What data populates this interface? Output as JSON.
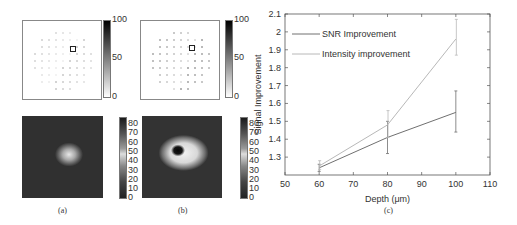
{
  "figure": {
    "panels": [
      {
        "id": "a",
        "caption": "(a)",
        "top_map": {
          "colorbar_ticks": [
            "100",
            "50",
            "0"
          ],
          "description": "sparse dot grid with highlighted square"
        },
        "bottom_image": {
          "colorbar_ticks": [
            "80",
            "70",
            "60",
            "50",
            "40",
            "30",
            "20",
            "10",
            "0"
          ],
          "description": "grayscale focus spot, single bright blob"
        }
      },
      {
        "id": "b",
        "caption": "(b)",
        "top_map": {
          "colorbar_ticks": [
            "100",
            "50",
            "0"
          ],
          "description": "denser dot grid with highlighted square"
        },
        "bottom_image": {
          "colorbar_ticks": [
            "80",
            "70",
            "60",
            "50",
            "40",
            "30",
            "20",
            "10",
            "0"
          ],
          "description": "grayscale focus spot, bright ring with dark center"
        }
      }
    ],
    "caption_c": "(c)"
  },
  "chart_data": {
    "type": "line",
    "title": "",
    "xlabel": "Depth (μm)",
    "ylabel": "Signal Improvement",
    "x": [
      60,
      80,
      100
    ],
    "xlim": [
      50,
      110
    ],
    "ylim": [
      1.2,
      2.1
    ],
    "xticks": [
      "50",
      "60",
      "70",
      "80",
      "90",
      "100",
      "110"
    ],
    "yticks": [
      "1.3",
      "1.4",
      "1.5",
      "1.6",
      "1.7",
      "1.8",
      "1.9",
      "2",
      "2.1"
    ],
    "grid": false,
    "legend_position": "upper left",
    "series": [
      {
        "name": "SNR Improvement",
        "color": "#707070",
        "values": [
          1.24,
          1.41,
          1.55
        ],
        "error_low": [
          1.22,
          1.32,
          1.44
        ],
        "error_high": [
          1.26,
          1.5,
          1.67
        ]
      },
      {
        "name": "Intensity improvement",
        "color": "#b8b8b8",
        "values": [
          1.25,
          1.48,
          1.96
        ],
        "error_low": [
          1.23,
          1.41,
          1.87
        ],
        "error_high": [
          1.28,
          1.56,
          2.07
        ]
      }
    ]
  }
}
